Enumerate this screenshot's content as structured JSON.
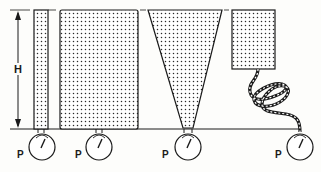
{
  "figure": {
    "height_label": "H",
    "gauge_label": "P",
    "colors": {
      "ink": "#1a1a1a",
      "fill_dots": "#2a2a2a",
      "background": "#fdfdfb"
    },
    "vessels": [
      {
        "name": "narrow-tube",
        "gauge_label": "P"
      },
      {
        "name": "wide-tank",
        "gauge_label": "P"
      },
      {
        "name": "inverted-cone",
        "gauge_label": "P"
      },
      {
        "name": "box-with-coiled-hose",
        "gauge_label": "P"
      }
    ]
  }
}
